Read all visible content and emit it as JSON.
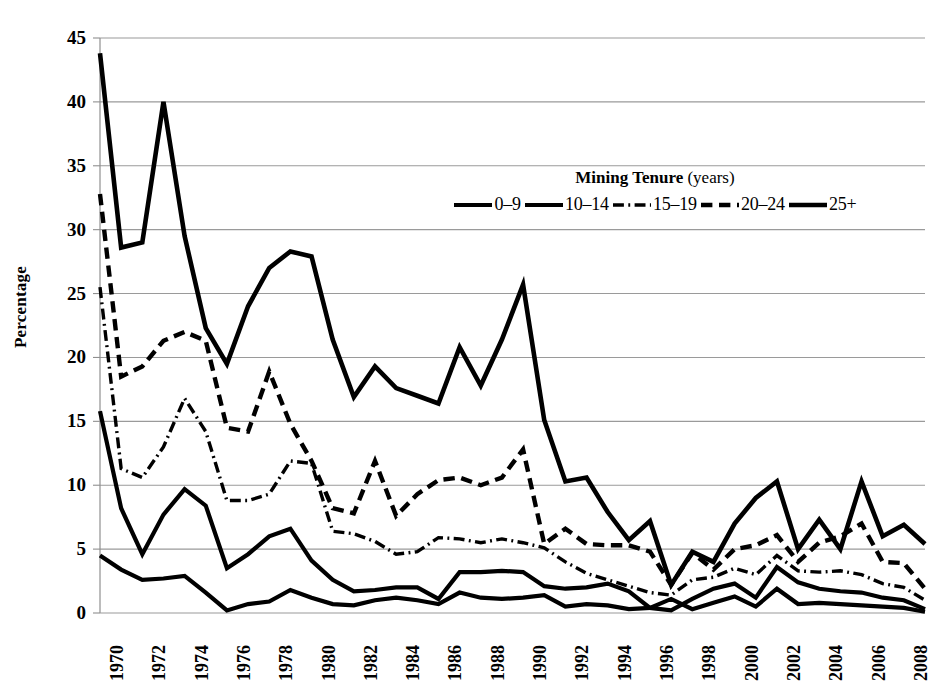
{
  "chart_data": {
    "type": "line",
    "title": "",
    "xlabel": "",
    "ylabel": "Percentage",
    "ylim": [
      0,
      45
    ],
    "ytick_step": 5,
    "yticks": [
      0,
      5,
      10,
      15,
      20,
      25,
      30,
      35,
      40,
      45
    ],
    "grid": true,
    "grid_axis": "y",
    "legend_position": "inside-top-right",
    "legend_title": "Mining Tenure",
    "legend_title_suffix": "(years)",
    "x": [
      1970,
      1971,
      1972,
      1973,
      1974,
      1975,
      1976,
      1977,
      1978,
      1979,
      1980,
      1981,
      1982,
      1983,
      1984,
      1985,
      1986,
      1987,
      1988,
      1989,
      1990,
      1991,
      1992,
      1993,
      1994,
      1995,
      1996,
      1997,
      1998,
      1999,
      2000,
      2001,
      2002,
      2003,
      2004,
      2005,
      2006,
      2007,
      2008,
      2009
    ],
    "xtick_labels": [
      "1970",
      "1972",
      "1974",
      "1976",
      "1978",
      "1980",
      "1982",
      "1984",
      "1986",
      "1988",
      "1990",
      "1992",
      "1994",
      "1996",
      "1998",
      "2000",
      "2002",
      "2004",
      "2006",
      "2008"
    ],
    "xtick_values": [
      1970,
      1972,
      1974,
      1976,
      1978,
      1980,
      1982,
      1984,
      1986,
      1988,
      1990,
      1992,
      1994,
      1996,
      1998,
      2000,
      2002,
      2004,
      2006,
      2008
    ],
    "series": [
      {
        "name": "0–9",
        "style": "solid",
        "width": 4.2,
        "color": "#000000",
        "values": [
          4.5,
          3.4,
          2.6,
          2.7,
          2.9,
          1.6,
          0.2,
          0.7,
          0.9,
          1.8,
          1.2,
          0.7,
          0.6,
          1.0,
          1.2,
          1.0,
          0.7,
          1.6,
          1.2,
          1.1,
          1.2,
          1.4,
          0.5,
          0.7,
          0.6,
          0.3,
          0.4,
          1.1,
          0.3,
          0.8,
          1.3,
          0.5,
          1.9,
          0.7,
          0.8,
          0.7,
          0.6,
          0.5,
          0.4,
          0.1
        ]
      },
      {
        "name": "10–14",
        "style": "solid",
        "width": 4.2,
        "color": "#000000",
        "values": [
          15.8,
          8.2,
          4.6,
          7.7,
          9.7,
          8.4,
          3.5,
          4.6,
          6.0,
          6.6,
          4.1,
          2.6,
          1.7,
          1.8,
          2.0,
          2.0,
          1.1,
          3.2,
          3.2,
          3.3,
          3.2,
          2.1,
          1.9,
          2.0,
          2.3,
          1.7,
          0.4,
          0.2,
          1.1,
          1.9,
          2.3,
          1.2,
          3.6,
          2.4,
          1.9,
          1.7,
          1.6,
          1.2,
          1.0,
          0.3
        ]
      },
      {
        "name": "15–19",
        "style": "dashdot",
        "width": 3.4,
        "color": "#000000",
        "values": [
          25.5,
          11.3,
          10.6,
          13.0,
          16.8,
          14.2,
          8.8,
          8.8,
          9.3,
          11.9,
          11.7,
          6.4,
          6.2,
          5.6,
          4.6,
          4.8,
          5.9,
          5.8,
          5.5,
          5.8,
          5.5,
          5.1,
          4.0,
          3.1,
          2.6,
          2.1,
          1.6,
          1.4,
          2.6,
          2.8,
          3.5,
          3.0,
          4.5,
          3.3,
          3.2,
          3.3,
          3.0,
          2.3,
          2.0,
          1.0
        ]
      },
      {
        "name": "20–24",
        "style": "dashed",
        "width": 4.4,
        "color": "#000000",
        "values": [
          32.8,
          18.5,
          19.3,
          21.3,
          22.0,
          21.3,
          14.5,
          14.2,
          18.9,
          14.8,
          11.9,
          8.2,
          7.8,
          11.9,
          7.6,
          9.3,
          10.4,
          10.6,
          10.0,
          10.6,
          12.8,
          5.4,
          6.6,
          5.4,
          5.3,
          5.3,
          4.8,
          2.2,
          4.7,
          3.4,
          5.0,
          5.3,
          6.1,
          4.0,
          5.5,
          6.0,
          7.0,
          4.0,
          3.9,
          1.9
        ]
      },
      {
        "name": "25+",
        "style": "solid",
        "width": 4.6,
        "color": "#000000",
        "values": [
          43.8,
          28.6,
          29.0,
          40.0,
          29.5,
          22.3,
          19.5,
          24.0,
          27.0,
          28.3,
          27.9,
          21.4,
          16.9,
          19.3,
          17.6,
          17.0,
          16.4,
          20.8,
          17.8,
          21.4,
          25.7,
          15.1,
          10.3,
          10.6,
          7.9,
          5.7,
          7.2,
          2.2,
          4.8,
          4.0,
          7.0,
          9.0,
          10.3,
          5.0,
          7.3,
          5.0,
          10.3,
          6.0,
          6.9,
          5.4
        ]
      }
    ]
  },
  "axes": {
    "y_axis_title": "Percentage"
  }
}
